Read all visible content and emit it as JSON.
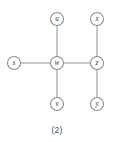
{
  "figure": {
    "caption": "(2)",
    "background_color": "#ffffff",
    "edge_color": "#9a9a9a",
    "node_stroke_color": "#8c8c8c",
    "node_fill_color": "#ffffff",
    "label_color": "#3a3a3a",
    "caption_color": "#4a4a4a"
  },
  "graph": {
    "node_radius": 6.5,
    "nodes": [
      {
        "id": "s",
        "label": "s",
        "cx": 14,
        "cy": 63
      },
      {
        "id": "u",
        "label": "u",
        "cx": 57,
        "cy": 19
      },
      {
        "id": "w",
        "label": "w",
        "cx": 57,
        "cy": 63
      },
      {
        "id": "v",
        "label": "v",
        "cx": 57,
        "cy": 104
      },
      {
        "id": "x",
        "label": "x",
        "cx": 97,
        "cy": 19
      },
      {
        "id": "z",
        "label": "z",
        "cx": 97,
        "cy": 63
      },
      {
        "id": "y",
        "label": "y",
        "cx": 97,
        "cy": 104
      }
    ],
    "edges": [
      {
        "id": "s-w",
        "from": "s",
        "to": "w",
        "x1": 20.5,
        "y1": 63,
        "x2": 50.5,
        "y2": 63
      },
      {
        "id": "u-w",
        "from": "u",
        "to": "w",
        "x1": 57,
        "y1": 25.5,
        "x2": 57,
        "y2": 56.5
      },
      {
        "id": "w-v",
        "from": "w",
        "to": "v",
        "x1": 57,
        "y1": 69.5,
        "x2": 57,
        "y2": 97.5
      },
      {
        "id": "w-z",
        "from": "w",
        "to": "z",
        "x1": 63.5,
        "y1": 63,
        "x2": 90.5,
        "y2": 63
      },
      {
        "id": "x-z",
        "from": "x",
        "to": "z",
        "x1": 97,
        "y1": 25.5,
        "x2": 97,
        "y2": 56.5
      },
      {
        "id": "z-y",
        "from": "z",
        "to": "y",
        "x1": 97,
        "y1": 69.5,
        "x2": 97,
        "y2": 97.5
      }
    ]
  },
  "caption_position": {
    "x": 57,
    "y": 130
  }
}
